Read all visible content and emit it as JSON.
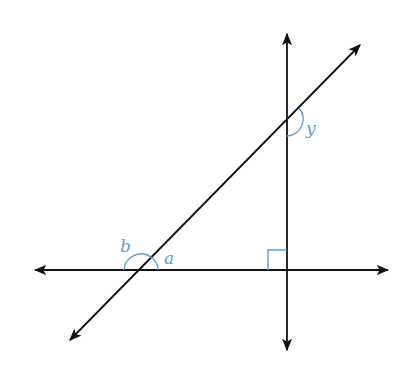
{
  "diagram": {
    "type": "geometry-lines-angles",
    "colors": {
      "line": "#111111",
      "annotation": "#5aa0d0",
      "background": "#ffffff"
    },
    "lines": [
      {
        "name": "horizontal-line",
        "x1": 33,
        "y1": 270,
        "x2": 390,
        "y2": 270
      },
      {
        "name": "vertical-line",
        "x1": 287,
        "y1": 32,
        "x2": 287,
        "y2": 352
      },
      {
        "name": "transversal-line",
        "x1": 68,
        "y1": 342,
        "x2": 362,
        "y2": 43
      }
    ],
    "angle_labels": {
      "a": "a",
      "b": "b",
      "y": "y"
    },
    "right_angle_marker": true
  }
}
